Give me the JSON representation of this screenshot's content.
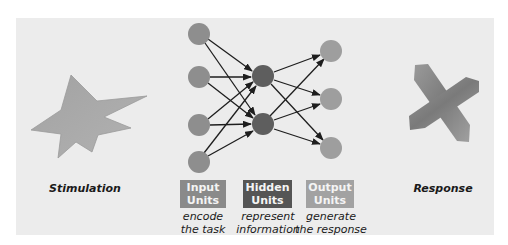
{
  "colors": {
    "panel_bg": "#ececec",
    "input_node": "#8e8e8e",
    "hidden_node": "#5e5e5e",
    "output_node": "#9e9e9e",
    "arrow": "#1e1e1e",
    "input_box": "#8a8a8a",
    "hidden_box": "#555555",
    "output_box": "#a2a2a2",
    "star_fill": "#a8a8a8",
    "x_fill": "#8c8c8c"
  },
  "stimulus": {
    "label": "Stimulation",
    "shape": "star-shape"
  },
  "response": {
    "label": "Response",
    "shape": "x-shape"
  },
  "layers": [
    {
      "name": "input",
      "title_line1": "Input",
      "title_line2": "Units",
      "desc_line1": "encode",
      "desc_line2": "the task",
      "node_count": 4
    },
    {
      "name": "hidden",
      "title_line1": "Hidden",
      "title_line2": "Units",
      "desc_line1": "represent",
      "desc_line2": "information",
      "node_count": 2
    },
    {
      "name": "output",
      "title_line1": "Output",
      "title_line2": "Units",
      "desc_line1": "generate",
      "desc_line2": "the response",
      "node_count": 3
    }
  ]
}
